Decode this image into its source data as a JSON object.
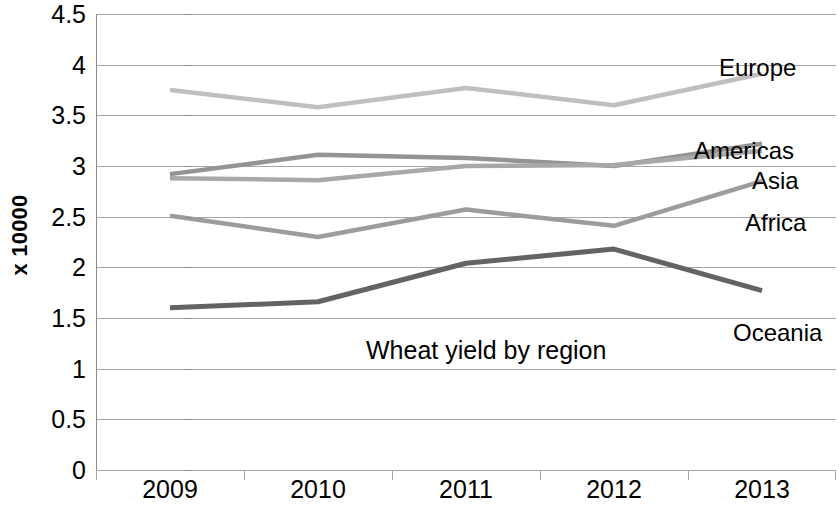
{
  "chart_data": {
    "type": "line",
    "title": "Wheat yield by region",
    "xlabel": "",
    "ylabel": "x 10000",
    "categories": [
      "2009",
      "2010",
      "2011",
      "2012",
      "2013"
    ],
    "ylim": [
      0,
      4.5
    ],
    "yticks": [
      "0",
      "0.5",
      "1",
      "1.5",
      "2",
      "2.5",
      "3",
      "3.5",
      "4",
      "4.5"
    ],
    "ytick_values": [
      0,
      0.5,
      1,
      1.5,
      2,
      2.5,
      3,
      3.5,
      4,
      4.5
    ],
    "grid": true,
    "legend_position": "inline-right-of-series",
    "series": [
      {
        "name": "Europe",
        "values": [
          3.75,
          3.58,
          3.77,
          3.6,
          3.91
        ],
        "color": "#bfbfbf"
      },
      {
        "name": "Americas",
        "values": [
          2.92,
          3.11,
          3.08,
          3.0,
          3.22
        ],
        "color": "#949494"
      },
      {
        "name": "Asia",
        "values": [
          2.88,
          2.86,
          3.0,
          3.01,
          3.15
        ],
        "color": "#a8a8a8"
      },
      {
        "name": "Africa",
        "values": [
          2.51,
          2.3,
          2.57,
          2.41,
          2.85
        ],
        "color": "#9c9c9c"
      },
      {
        "name": "Oceania",
        "values": [
          1.6,
          1.66,
          2.04,
          2.18,
          1.77
        ],
        "color": "#636363"
      }
    ]
  },
  "annotations": {
    "inline_title": "Wheat yield by region",
    "series_labels": [
      {
        "text": "Europe",
        "x": 719,
        "y": 56
      },
      {
        "text": "Americas",
        "x": 694,
        "y": 139
      },
      {
        "text": "Asia",
        "x": 752,
        "y": 169
      },
      {
        "text": "Africa",
        "x": 745,
        "y": 211
      },
      {
        "text": "Oceania",
        "x": 733,
        "y": 321
      }
    ]
  },
  "colors": {
    "background": "#ffffff",
    "gridline": "#a6a6a6",
    "axis": "#8c8c8c",
    "text": "#000000"
  }
}
